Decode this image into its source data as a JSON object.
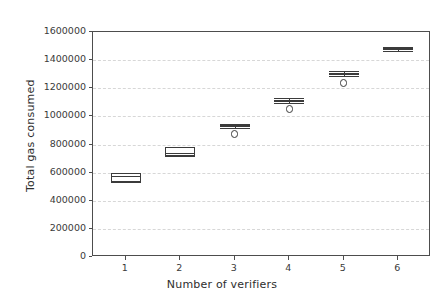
{
  "chart_data": {
    "type": "box",
    "title": "",
    "xlabel": "Number of verifiers",
    "ylabel": "Total gas consumed",
    "categories": [
      "1",
      "2",
      "3",
      "4",
      "5",
      "6"
    ],
    "xticklabels": [
      "1",
      "2",
      "3",
      "4",
      "5",
      "6"
    ],
    "yticklabels": [
      "0",
      "200000",
      "400000",
      "600000",
      "800000",
      "1000000",
      "1200000",
      "1400000",
      "1600000"
    ],
    "ytickvalues": [
      0,
      200000,
      400000,
      600000,
      800000,
      1000000,
      1200000,
      1400000,
      1600000
    ],
    "xlim": [
      0.4,
      6.6
    ],
    "ylim": [
      0,
      1600000
    ],
    "grid": "horizontal-dashed",
    "legend": "none",
    "box_color": "#3b3b3b",
    "box_fill": "#ffffff",
    "grid_color": "#d7d7d7",
    "axis_color": "#4d4d4d",
    "boxes": [
      {
        "category": "1",
        "whisker_low": 533000,
        "q1": 533000,
        "median": 576000,
        "q3": 597000,
        "whisker_high": 597000,
        "fliers": []
      },
      {
        "category": "2",
        "whisker_low": 718000,
        "q1": 718000,
        "median": 740000,
        "q3": 782000,
        "whisker_high": 782000,
        "fliers": []
      },
      {
        "category": "3",
        "whisker_low": 918000,
        "q1": 925000,
        "median": 932000,
        "q3": 939000,
        "whisker_high": 946000,
        "fliers": [
          875000
        ]
      },
      {
        "category": "4",
        "whisker_low": 1096000,
        "q1": 1102000,
        "median": 1110000,
        "q3": 1117000,
        "whisker_high": 1131000,
        "fliers": [
          1052000
        ]
      },
      {
        "category": "5",
        "whisker_low": 1288000,
        "q1": 1294000,
        "median": 1302000,
        "q3": 1309000,
        "whisker_high": 1323000,
        "fliers": [
          1237000
        ]
      },
      {
        "category": "6",
        "whisker_low": 1465000,
        "q1": 1472000,
        "median": 1479000,
        "q3": 1486000,
        "whisker_high": 1493000,
        "fliers": []
      }
    ]
  }
}
